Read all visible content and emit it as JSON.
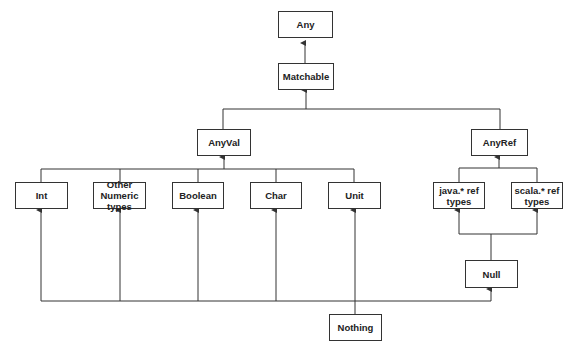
{
  "diagram": {
    "type": "class-hierarchy",
    "nodes": {
      "any": {
        "label": "Any"
      },
      "matchable": {
        "label": "Matchable"
      },
      "anyval": {
        "label": "AnyVal"
      },
      "anyref": {
        "label": "AnyRef"
      },
      "int": {
        "label": "Int"
      },
      "other_numeric": {
        "label": "Other Numeric types"
      },
      "boolean": {
        "label": "Boolean"
      },
      "char": {
        "label": "Char"
      },
      "unit": {
        "label": "Unit"
      },
      "java_ref": {
        "label": "java.* ref types"
      },
      "scala_ref": {
        "label": "scala.* ref types"
      },
      "null": {
        "label": "Null"
      },
      "nothing": {
        "label": "Nothing"
      }
    },
    "edges": [
      {
        "from": "Matchable",
        "to": "Any"
      },
      {
        "from": "AnyVal",
        "to": "Matchable"
      },
      {
        "from": "AnyRef",
        "to": "Matchable"
      },
      {
        "from": "Int",
        "to": "AnyVal"
      },
      {
        "from": "Other Numeric types",
        "to": "AnyVal"
      },
      {
        "from": "Boolean",
        "to": "AnyVal"
      },
      {
        "from": "Char",
        "to": "AnyVal"
      },
      {
        "from": "Unit",
        "to": "AnyVal"
      },
      {
        "from": "java.* ref types",
        "to": "AnyRef"
      },
      {
        "from": "scala.* ref types",
        "to": "AnyRef"
      },
      {
        "from": "Null",
        "to": "java.* ref types"
      },
      {
        "from": "Null",
        "to": "scala.* ref types"
      },
      {
        "from": "Nothing",
        "to": "Int"
      },
      {
        "from": "Nothing",
        "to": "Other Numeric types"
      },
      {
        "from": "Nothing",
        "to": "Boolean"
      },
      {
        "from": "Nothing",
        "to": "Char"
      },
      {
        "from": "Nothing",
        "to": "Unit"
      },
      {
        "from": "Nothing",
        "to": "Null"
      }
    ],
    "colors": {
      "line": "#333333",
      "box_border": "#333333",
      "text": "#222222",
      "background": "#ffffff"
    }
  }
}
